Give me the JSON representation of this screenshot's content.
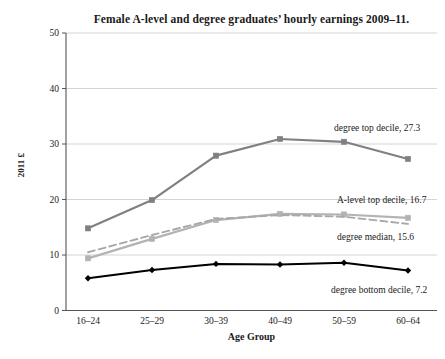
{
  "chart_data": {
    "type": "line",
    "title": "Female A-level and degree graduates’ hourly earnings 2009–11.",
    "xlabel": "Age Group",
    "ylabel": "2011 £",
    "categories": [
      "16–24",
      "25–29",
      "30–39",
      "40–49",
      "50–59",
      "60–64"
    ],
    "yticks": [
      "0",
      "10",
      "20",
      "30",
      "40",
      "50"
    ],
    "ylim": [
      0,
      50
    ],
    "grid": true,
    "legend_position": "inline-annotations",
    "series": [
      {
        "name": "degree top decile",
        "end_label": "degree top decile, 27.3",
        "end_value": 27.3,
        "color": "#808080",
        "style": "solid",
        "marker": "square",
        "values": [
          14.8,
          19.9,
          27.9,
          30.9,
          30.4,
          27.3
        ]
      },
      {
        "name": "A-level top decile",
        "end_label": "A-level top decile, 16.7",
        "end_value": 16.7,
        "color": "#b3b3b3",
        "style": "solid",
        "marker": "square",
        "values": [
          9.4,
          12.9,
          16.3,
          17.4,
          17.3,
          16.7
        ]
      },
      {
        "name": "degree median",
        "end_label": "degree median, 15.6",
        "end_value": 15.6,
        "color": "#a8a8a8",
        "style": "dashed",
        "marker": "none",
        "values": [
          10.5,
          13.6,
          16.5,
          17.2,
          16.9,
          15.6
        ]
      },
      {
        "name": "degree bottom decile",
        "end_label": "degree bottom decile, 7.2",
        "end_value": 7.2,
        "color": "#000000",
        "style": "solid",
        "marker": "diamond",
        "values": [
          5.8,
          7.3,
          8.4,
          8.3,
          8.6,
          7.2
        ]
      }
    ]
  }
}
